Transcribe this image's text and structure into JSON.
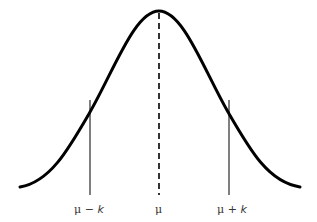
{
  "diagram": {
    "title": "",
    "curve": {
      "type": "normal-distribution",
      "stroke": "#000000"
    },
    "mean_line": {
      "style": "dashed",
      "label": "μ"
    },
    "left_line": {
      "label_mu": "μ",
      "label_op": " − ",
      "label_k": "k"
    },
    "right_line": {
      "label_mu": "μ",
      "label_op": " + ",
      "label_k": "k"
    }
  }
}
